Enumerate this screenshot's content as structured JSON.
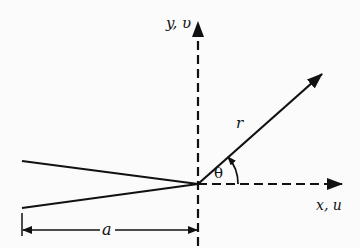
{
  "diagram": {
    "type": "crack-tip coordinate system",
    "colors": {
      "stroke": "#111111",
      "background": "#fbfbfb"
    },
    "labels": {
      "y_axis": "y, υ",
      "x_axis": "x, u",
      "radius": "r",
      "angle": "θ",
      "crack_length": "a"
    },
    "elements": [
      {
        "name": "y-axis",
        "style": "dashed",
        "arrow": "up"
      },
      {
        "name": "x-axis",
        "style": "dashed",
        "arrow": "right"
      },
      {
        "name": "radius-vector",
        "style": "solid",
        "arrow": "tip",
        "label": "r"
      },
      {
        "name": "angle-arc",
        "label": "θ",
        "arrow": "counterclockwise"
      },
      {
        "name": "crack-upper-face",
        "style": "solid"
      },
      {
        "name": "crack-lower-face",
        "style": "solid"
      },
      {
        "name": "crack-length-dimension",
        "label": "a",
        "arrows": "both"
      }
    ]
  }
}
